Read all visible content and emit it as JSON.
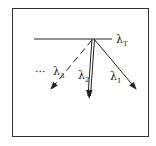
{
  "diagram": {
    "frame_color": "#333333",
    "line_color": "#222222",
    "labels": {
      "threshold": {
        "symbol": "λ",
        "sub": "T"
      },
      "ray1": {
        "symbol": "λ",
        "sub": "1"
      },
      "ray2": {
        "symbol": "λ",
        "sub": "2"
      },
      "ray3": {
        "symbol": "λ",
        "sub": "3"
      },
      "ellipsis": "···"
    }
  }
}
